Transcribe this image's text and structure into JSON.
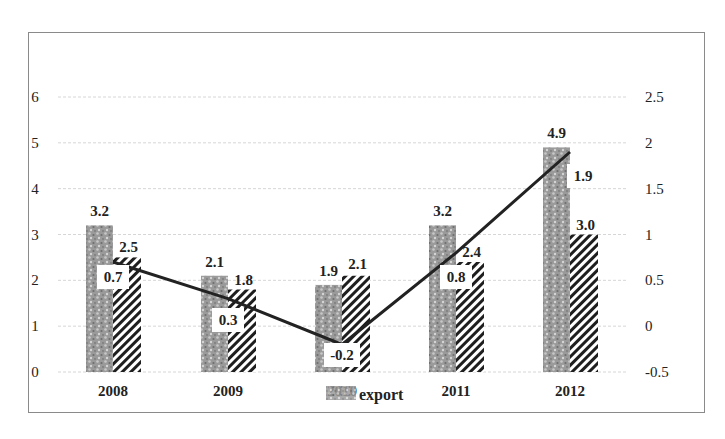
{
  "chart_data": {
    "type": "bar+line",
    "title": "",
    "categories": [
      "2008",
      "2009",
      "2010",
      "2011",
      "2012"
    ],
    "series": [
      {
        "name": "",
        "type": "bar",
        "axis": "left",
        "pattern": "speckled-gray",
        "values": [
          3.2,
          2.1,
          1.9,
          3.2,
          4.9
        ]
      },
      {
        "name": "export",
        "type": "bar",
        "axis": "left",
        "pattern": "diagonal-hatch",
        "values": [
          2.5,
          1.8,
          2.1,
          2.4,
          3.0
        ]
      },
      {
        "name": "",
        "type": "line",
        "axis": "right",
        "color": "#222222",
        "values": [
          0.7,
          0.3,
          -0.2,
          0.8,
          1.9
        ]
      }
    ],
    "y_left": {
      "ticks": [
        "0",
        "1",
        "2",
        "3",
        "4",
        "5",
        "6"
      ],
      "ylim": [
        0,
        6
      ]
    },
    "y_right": {
      "ticks": [
        "-0.5",
        "0",
        "0.5",
        "1",
        "1.5",
        "2",
        "2.5"
      ],
      "ylim": [
        -0.5,
        2.5
      ]
    },
    "grid": true,
    "legend": {
      "position": "bottom-center",
      "entries": [
        "export"
      ]
    },
    "xlabel": "",
    "ylabel": "",
    "ylabel_right": ""
  }
}
